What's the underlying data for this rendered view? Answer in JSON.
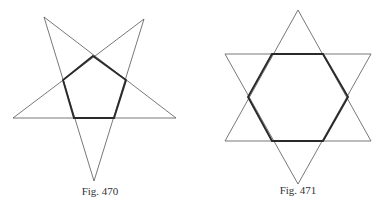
{
  "figures": [
    {
      "id": "fig-470",
      "caption": "Fig. 470",
      "description": "Regular pentagram (five-pointed star) with its inner regular pentagon drawn in bold",
      "star": {
        "type": "pentagram",
        "vertices": [
          [
            44,
            17
          ],
          [
            176,
            118
          ],
          [
            13,
            118
          ],
          [
            144,
            19
          ],
          [
            94,
            181
          ]
        ]
      },
      "inner_polygon": {
        "type": "pentagon",
        "vertices": [
          [
            93,
            56
          ],
          [
            126,
            80
          ],
          [
            114,
            118
          ],
          [
            74,
            118
          ],
          [
            63,
            80
          ]
        ]
      },
      "caption_pos": [
        100,
        193
      ]
    },
    {
      "id": "fig-471",
      "caption": "Fig. 471",
      "description": "Regular hexagram (six-pointed star formed by two overlapping equilateral triangles) with its inner regular hexagon drawn in bold",
      "star": {
        "type": "hexagram",
        "triangle_up": [
          [
            298,
            10
          ],
          [
            371,
            141
          ],
          [
            225,
            141
          ]
        ],
        "triangle_down": [
          [
            225,
            54
          ],
          [
            371,
            54
          ],
          [
            298,
            184
          ]
        ]
      },
      "inner_polygon": {
        "type": "hexagon",
        "vertices": [
          [
            272,
            54
          ],
          [
            323,
            54
          ],
          [
            348,
            97
          ],
          [
            323,
            141
          ],
          [
            272,
            141
          ],
          [
            248,
            97
          ]
        ]
      },
      "caption_pos": [
        298,
        192
      ]
    }
  ],
  "colors": {
    "thin_line": "#555555",
    "thick_line": "#2a2a2a",
    "background": "#ffffff",
    "text": "#333333"
  }
}
